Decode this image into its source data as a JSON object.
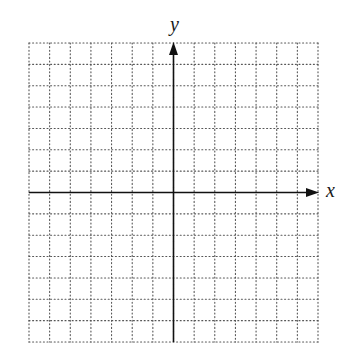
{
  "chart_data": {
    "type": "coordinate-grid",
    "title": "",
    "xlabel": "x",
    "ylabel": "y",
    "grid": true,
    "grid_style": "dotted",
    "columns": 14,
    "rows": 14,
    "x_range": [
      -7,
      7
    ],
    "y_range": [
      -7,
      7
    ],
    "origin_column": 7,
    "origin_row": 7,
    "axis_arrows": [
      "positive-x",
      "positive-y"
    ],
    "tick_labels": [],
    "data_points": []
  },
  "axes": {
    "x_label": "x",
    "y_label": "y"
  },
  "colors": {
    "grid": "#555555",
    "axis": "#111111",
    "background": "#ffffff"
  },
  "layout": {
    "left": 29,
    "right": 318,
    "top": 43,
    "bottom": 342,
    "origin_x": 173,
    "origin_y": 193
  }
}
